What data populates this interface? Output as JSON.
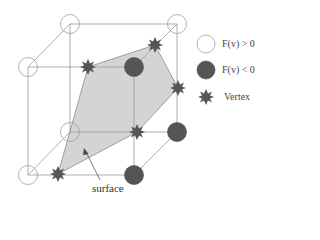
{
  "diagram": {
    "colors": {
      "edge": "#9a9a9a",
      "positive_fill": "#ffffff",
      "positive_stroke": "#a0a0a0",
      "negative_fill": "#555555",
      "vertex_star": "#555555",
      "surface_fill": "#d4d4d4",
      "surface_stroke": "#8a8a8a"
    },
    "cube_corners": [
      {
        "id": "back-top-left",
        "x": 70,
        "y": 24,
        "sign": "positive"
      },
      {
        "id": "back-top-right",
        "x": 177,
        "y": 24,
        "sign": "positive"
      },
      {
        "id": "back-bottom-left",
        "x": 70,
        "y": 132,
        "sign": "positive"
      },
      {
        "id": "back-bottom-right",
        "x": 177,
        "y": 132,
        "sign": "negative"
      },
      {
        "id": "front-top-left",
        "x": 28,
        "y": 67,
        "sign": "positive"
      },
      {
        "id": "front-top-right",
        "x": 134,
        "y": 67,
        "sign": "negative"
      },
      {
        "id": "front-bottom-left",
        "x": 28,
        "y": 175,
        "sign": "positive"
      },
      {
        "id": "front-bottom-right",
        "x": 134,
        "y": 175,
        "sign": "negative"
      }
    ],
    "vertices": [
      {
        "x": 88,
        "y": 67
      },
      {
        "x": 155,
        "y": 45
      },
      {
        "x": 178,
        "y": 88
      },
      {
        "x": 137,
        "y": 132
      },
      {
        "x": 58,
        "y": 174
      }
    ],
    "surface_label": "surface"
  },
  "legend": {
    "items": [
      {
        "symbol": "open-circle",
        "label": "F(v) > 0"
      },
      {
        "symbol": "filled-circle",
        "label": "F(v) < 0"
      },
      {
        "symbol": "star",
        "label": "Vertex"
      }
    ]
  }
}
